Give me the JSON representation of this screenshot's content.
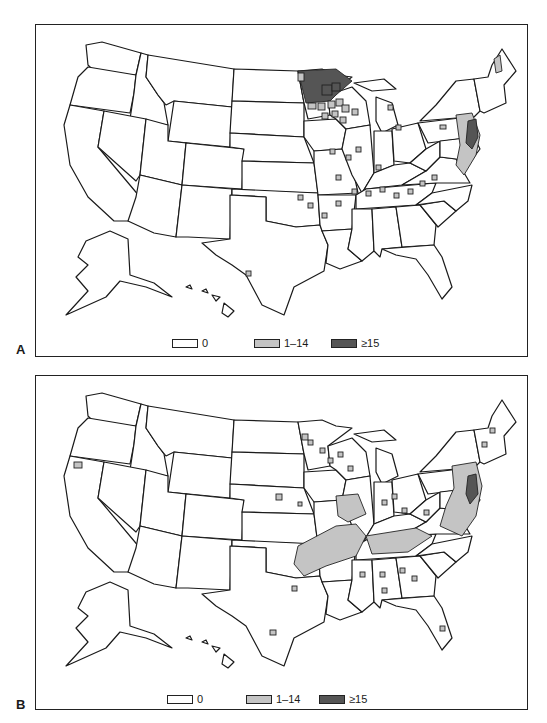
{
  "figure": {
    "panels": [
      {
        "label": "A",
        "legend": [
          {
            "label": "0",
            "color": "#ffffff"
          },
          {
            "label": "1–14",
            "color": "#c4c4c4"
          },
          {
            "label": "≥15",
            "color": "#555555"
          }
        ]
      },
      {
        "label": "B",
        "legend": [
          {
            "label": "0",
            "color": "#ffffff"
          },
          {
            "label": "1–14",
            "color": "#c4c4c4"
          },
          {
            "label": "≥15",
            "color": "#555555"
          }
        ]
      }
    ]
  }
}
